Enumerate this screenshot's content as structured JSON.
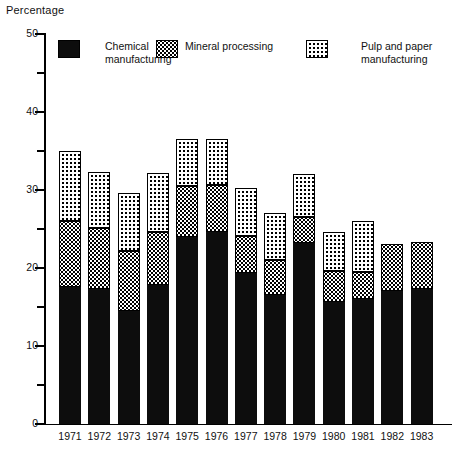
{
  "chart_data": {
    "type": "bar",
    "subtype": "stacked-bar",
    "title": "",
    "ylabel": "Percentage",
    "xlabel": "",
    "ylim": [
      0,
      50
    ],
    "ytick_major": [
      0,
      10,
      20,
      30,
      40,
      50
    ],
    "ytick_minor": [
      5,
      15,
      25,
      35,
      45
    ],
    "grid": false,
    "legend_position": "top",
    "categories": [
      "1971",
      "1972",
      "1973",
      "1974",
      "1975",
      "1976",
      "1977",
      "1978",
      "1979",
      "1980",
      "1981",
      "1982",
      "1983"
    ],
    "series": [
      {
        "name": "Chemical manufacturing",
        "pattern": "solid-black",
        "color": "#0d0d0d",
        "values": [
          17.5,
          17.2,
          14.4,
          17.7,
          23.9,
          24.6,
          19.3,
          16.5,
          23.1,
          15.6,
          15.9,
          17.0,
          17.2
        ]
      },
      {
        "name": "Mineral processing",
        "pattern": "dense-checker",
        "color": "#ffffff",
        "values": [
          8.4,
          7.9,
          7.7,
          6.9,
          6.6,
          6.0,
          4.8,
          4.5,
          3.4,
          3.9,
          3.5,
          6.0,
          6.1
        ]
      },
      {
        "name": "Pulp and paper manufacturing",
        "pattern": "sparse-dot",
        "color": "#ffffff",
        "values": [
          9.1,
          7.2,
          7.5,
          7.5,
          6.0,
          5.9,
          6.1,
          6.0,
          5.5,
          5.0,
          6.6,
          0.0,
          0.0
        ]
      }
    ],
    "totals": [
      35.0,
      32.3,
      29.6,
      32.1,
      36.5,
      36.5,
      30.2,
      27.0,
      32.0,
      24.5,
      26.0,
      23.0,
      23.3
    ]
  },
  "axis": {
    "y_title": "Percentage",
    "y_labels": [
      "50",
      "40",
      "30",
      "20",
      "10",
      "0"
    ],
    "x_labels": [
      "1971",
      "1972",
      "1973",
      "1974",
      "1975",
      "1976",
      "1977",
      "1978",
      "1979",
      "1980",
      "1981",
      "1982",
      "1983"
    ]
  },
  "legend": {
    "items": [
      {
        "label": "Chemical\nmanufacturing",
        "swatch": "solid-black-swatch"
      },
      {
        "label": "Mineral processing",
        "swatch": "dense-checker-swatch"
      },
      {
        "label": "Pulp and paper\nmanufacturing",
        "swatch": "sparse-dot-swatch"
      }
    ]
  }
}
